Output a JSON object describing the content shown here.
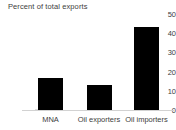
{
  "chart_data": {
    "type": "bar",
    "title": "Percent of total exports",
    "xlabel": "",
    "ylabel": "",
    "categories": [
      "MNA",
      "Oil exporters",
      "Oil importers"
    ],
    "values": [
      16.7,
      13,
      43.2
    ],
    "ylim": [
      0,
      50
    ],
    "yticks": [
      0,
      10,
      20,
      30,
      40,
      50
    ],
    "ytick_labels": [
      "0",
      "10",
      "20",
      "30",
      "40",
      "50"
    ],
    "grid": false,
    "legend": null,
    "bar_color": "#000000",
    "axis_color": "#d2d2d2",
    "text_color": "#3d3d3d",
    "background_color": "#ffffff"
  }
}
